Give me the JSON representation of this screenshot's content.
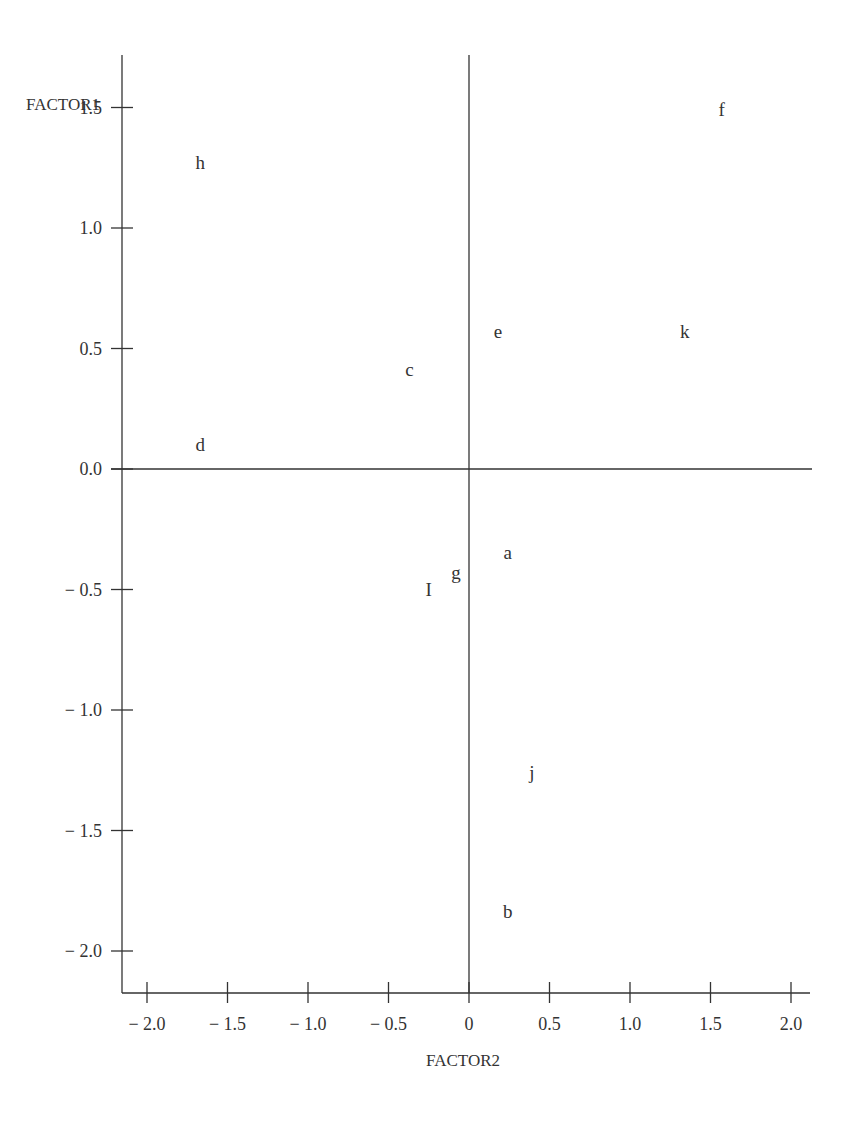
{
  "chart_data": {
    "type": "scatter",
    "title": "",
    "xlabel": "FACTOR2",
    "ylabel": "FACTOR1",
    "xlim": [
      -2.15,
      2.15
    ],
    "ylim": [
      -2.2,
      1.7
    ],
    "x_ticks": [
      -2.0,
      -1.5,
      -1.0,
      -0.5,
      0,
      0.5,
      1.0,
      1.5,
      2.0
    ],
    "x_tick_labels": [
      "− 2.0",
      "− 1.5",
      "− 1.0",
      "− 0.5",
      "0",
      "0.5",
      "1.0",
      "1.5",
      "2.0"
    ],
    "y_ticks": [
      1.5,
      1.0,
      0.5,
      0.0,
      -0.5,
      -1.0,
      -1.5,
      -2.0
    ],
    "y_tick_labels": [
      "1.5",
      "1.0",
      "0.5",
      "0.0",
      "− 0.5",
      "− 1.0",
      "− 1.5",
      "− 2.0"
    ],
    "grid": false,
    "legend": null,
    "reference_lines": {
      "x0": true,
      "y0": true
    },
    "points": [
      {
        "label": "f",
        "x": 1.57,
        "y": 1.49
      },
      {
        "label": "h",
        "x": -1.67,
        "y": 1.27
      },
      {
        "label": "e",
        "x": 0.18,
        "y": 0.57
      },
      {
        "label": "k",
        "x": 1.34,
        "y": 0.57
      },
      {
        "label": "c",
        "x": -0.37,
        "y": 0.41
      },
      {
        "label": "d",
        "x": -1.67,
        "y": 0.1
      },
      {
        "label": "a",
        "x": 0.24,
        "y": -0.35
      },
      {
        "label": "g",
        "x": -0.08,
        "y": -0.43
      },
      {
        "label": "I",
        "x": -0.25,
        "y": -0.5
      },
      {
        "label": "j",
        "x": 0.39,
        "y": -1.26
      },
      {
        "label": "b",
        "x": 0.24,
        "y": -1.84
      }
    ]
  },
  "colors": {
    "ink": "#333333",
    "background": "#ffffff"
  }
}
